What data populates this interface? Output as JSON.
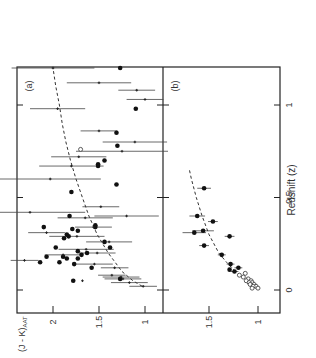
{
  "figure": {
    "panel_a_label": "(a)",
    "panel_b_label": "(b)",
    "xlabel": "Redshift (z)",
    "ylabel": "(J - K)AAT",
    "ylabel_main": "(J - K)",
    "ylabel_sub": "AAT",
    "x_ticks": [
      "0",
      "0.5",
      "1"
    ],
    "y_ticks_a": [
      "2",
      "1.5",
      "1"
    ],
    "y_ticks_b": [
      "1.5",
      "1"
    ],
    "orientation": "rotated 90° counter-clockwise"
  },
  "chart_data": [
    {
      "type": "scatter",
      "panel": "(a)",
      "title": "",
      "xlabel": "Redshift (z)",
      "ylabel": "(J - K)AAT",
      "xlim": [
        -0.1,
        1.3
      ],
      "ylim": [
        0.9,
        2.4
      ],
      "x_ticks": [
        0,
        0.5,
        1
      ],
      "y_ticks": [
        1,
        1.5,
        2
      ],
      "grid": false,
      "series": [
        {
          "name": "filled circles",
          "marker": "filled-circle",
          "points": [
            [
              1.2,
              1.27
            ],
            [
              0.98,
              1.1
            ],
            [
              0.85,
              1.31
            ],
            [
              0.78,
              1.3
            ],
            [
              0.7,
              1.44
            ],
            [
              0.68,
              1.51
            ],
            [
              0.67,
              1.51
            ],
            [
              0.57,
              1.31
            ],
            [
              0.53,
              1.8
            ],
            [
              0.4,
              1.82
            ],
            [
              0.35,
              1.54
            ],
            [
              0.34,
              1.54
            ],
            [
              0.34,
              2.1
            ],
            [
              0.33,
              1.79
            ],
            [
              0.32,
              1.73
            ],
            [
              0.3,
              1.85
            ],
            [
              0.29,
              1.83
            ],
            [
              0.28,
              1.88
            ],
            [
              0.26,
              1.44
            ],
            [
              0.23,
              1.38
            ],
            [
              0.23,
              1.97
            ],
            [
              0.21,
              1.73
            ],
            [
              0.2,
              1.63
            ],
            [
              0.19,
              1.69
            ],
            [
              0.18,
              2.07
            ],
            [
              0.18,
              1.89
            ],
            [
              0.17,
              1.85
            ],
            [
              0.17,
              1.73
            ],
            [
              0.15,
              1.93
            ],
            [
              0.15,
              2.14
            ],
            [
              0.14,
              1.77
            ],
            [
              0.12,
              1.58
            ],
            [
              0.06,
              1.27
            ],
            [
              0.05,
              1.78
            ]
          ]
        },
        {
          "name": "crosses with error bars",
          "marker": "cross",
          "points": [
            [
              1.2,
              2.0,
              0.45
            ],
            [
              1.12,
              1.5,
              0.35
            ],
            [
              1.08,
              1.09,
              0.2
            ],
            [
              1.03,
              1.0,
              0.2
            ],
            [
              0.98,
              1.95,
              0.3
            ],
            [
              0.86,
              1.5,
              0.2
            ],
            [
              0.8,
              1.11,
              0.35
            ],
            [
              0.75,
              1.25,
              0.5
            ],
            [
              0.72,
              1.72,
              0.3
            ],
            [
              0.67,
              1.8,
              0.35
            ],
            [
              0.6,
              2.03,
              0.55
            ],
            [
              0.45,
              1.48,
              0.2
            ],
            [
              0.42,
              2.25,
              0.6
            ],
            [
              0.4,
              1.2,
              0.35
            ],
            [
              0.39,
              1.65,
              0.3
            ],
            [
              0.34,
              1.56,
              0.2
            ],
            [
              0.31,
              2.07,
              0.2
            ],
            [
              0.29,
              1.74,
              0.3
            ],
            [
              0.26,
              1.39,
              0.25
            ],
            [
              0.22,
              1.64,
              0.3
            ],
            [
              0.2,
              1.52,
              0.2
            ],
            [
              0.19,
              1.89,
              0.2
            ],
            [
              0.16,
              2.31,
              0.15
            ],
            [
              0.14,
              1.55,
              0.2
            ],
            [
              0.12,
              1.33,
              0.15
            ],
            [
              0.08,
              1.36,
              0.15
            ],
            [
              0.07,
              1.26,
              0.2
            ],
            [
              0.06,
              1.24,
              0.2
            ],
            [
              0.05,
              1.68,
              0.02
            ],
            [
              0.04,
              1.17,
              0.2
            ],
            [
              0.02,
              1.02,
              0.15
            ]
          ]
        },
        {
          "name": "open circle",
          "marker": "open-circle",
          "points": [
            [
              0.76,
              1.7
            ]
          ]
        }
      ],
      "curve": {
        "name": "model (dashed)",
        "style": "dashed",
        "points": [
          [
            0.02,
            1.03
          ],
          [
            0.05,
            1.13
          ],
          [
            0.1,
            1.25
          ],
          [
            0.2,
            1.4
          ],
          [
            0.3,
            1.52
          ],
          [
            0.4,
            1.61
          ],
          [
            0.5,
            1.68
          ],
          [
            0.6,
            1.75
          ],
          [
            0.7,
            1.81
          ],
          [
            0.8,
            1.86
          ],
          [
            0.9,
            1.9
          ],
          [
            1.0,
            1.93
          ],
          [
            1.1,
            1.97
          ],
          [
            1.2,
            2.0
          ]
        ]
      }
    },
    {
      "type": "scatter",
      "panel": "(b)",
      "title": "",
      "xlabel": "Redshift (z)",
      "ylabel": "(J - K)AAT",
      "xlim": [
        -0.1,
        1.3
      ],
      "ylim": [
        0.9,
        1.8
      ],
      "x_ticks": [
        0,
        0.5,
        1
      ],
      "y_ticks": [
        1,
        1.5
      ],
      "grid": false,
      "series": [
        {
          "name": "filled circles with error bars",
          "marker": "filled-circle",
          "points": [
            [
              0.55,
              1.55,
              0.07
            ],
            [
              0.4,
              1.62,
              0.08
            ],
            [
              0.37,
              1.46,
              0.05
            ],
            [
              0.32,
              1.56,
              0.11
            ],
            [
              0.31,
              1.65,
              0.12
            ],
            [
              0.29,
              1.29,
              0.05
            ],
            [
              0.24,
              1.55,
              0.05
            ],
            [
              0.19,
              1.37,
              0.04
            ],
            [
              0.14,
              1.28,
              0.04
            ],
            [
              0.12,
              1.2,
              0.04
            ],
            [
              0.11,
              1.29,
              0.03
            ],
            [
              0.1,
              1.24,
              0.04
            ]
          ]
        },
        {
          "name": "open circles",
          "marker": "open-circle",
          "points": [
            [
              0.09,
              1.13
            ],
            [
              0.08,
              1.19
            ],
            [
              0.07,
              1.15
            ],
            [
              0.06,
              1.1
            ],
            [
              0.05,
              1.07
            ],
            [
              0.05,
              1.12
            ],
            [
              0.04,
              1.06
            ],
            [
              0.04,
              1.09
            ],
            [
              0.03,
              1.04
            ],
            [
              0.03,
              1.08
            ],
            [
              0.02,
              1.02
            ],
            [
              0.01,
              1.0
            ],
            [
              0.02,
              1.05
            ],
            [
              0.01,
              1.06
            ]
          ]
        }
      ],
      "curve": {
        "name": "model (dashed)",
        "style": "dashed",
        "points": [
          [
            0.1,
            1.23
          ],
          [
            0.15,
            1.32
          ],
          [
            0.2,
            1.4
          ],
          [
            0.3,
            1.5
          ],
          [
            0.4,
            1.57
          ],
          [
            0.5,
            1.63
          ],
          [
            0.6,
            1.68
          ],
          [
            0.65,
            1.7
          ]
        ]
      }
    }
  ]
}
